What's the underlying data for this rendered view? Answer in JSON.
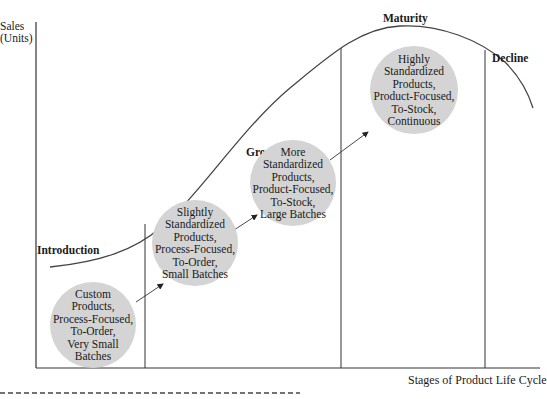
{
  "figure": {
    "y_axis_label_line1": "Sales",
    "y_axis_label_line2": "(Units)",
    "x_axis_label": "Stages of Product Life Cycle"
  },
  "stages": [
    {
      "label": "Introduction"
    },
    {
      "label": "Growth"
    },
    {
      "label": "Maturity"
    },
    {
      "label": "Decline"
    }
  ],
  "bubbles": [
    {
      "lines": [
        "Custom",
        "Products,",
        "Process-Focused,",
        "To-Order,",
        "Very Small",
        "Batches"
      ]
    },
    {
      "lines": [
        "Slightly",
        "Standardized",
        "Products,",
        "Process-Focused,",
        "To-Order,",
        "Small Batches"
      ]
    },
    {
      "lines": [
        "More",
        "Standardized",
        "Products,",
        "Product-Focused,",
        "To-Stock,",
        "Large Batches"
      ]
    },
    {
      "lines": [
        "Highly",
        "Standardized",
        "Products,",
        "Product-Focused,",
        "To-Stock,",
        "Continuous"
      ]
    }
  ],
  "colors": {
    "bubble_fill": "#d4d4d4",
    "line": "#333333"
  }
}
